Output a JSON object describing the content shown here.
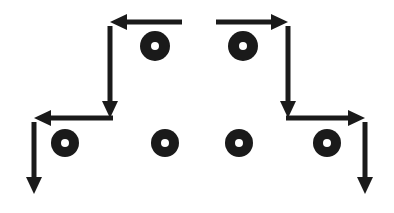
{
  "figure": {
    "canvas": {
      "width": 394,
      "height": 213,
      "background_color": "#ffffff"
    },
    "ink_color": "#1a1a1a",
    "ring_hole_color": "#ffffff"
  },
  "chart_data": {
    "type": "diagram",
    "xlabel": "",
    "ylabel": "",
    "xlim": [
      0,
      394
    ],
    "ylim": [
      0,
      213
    ],
    "grid": false,
    "legend": "none",
    "stroke_width": 5,
    "arrow_head_length": 17,
    "arrow_head_half_width": 8,
    "arrows": [
      {
        "id": "top-left-horizontal-arrow",
        "name": "top-left-horizontal-arrow",
        "orientation": "horizontal",
        "direction": "left",
        "x1": 182,
        "y1": 22,
        "x2": 110,
        "y2": 22,
        "length": 72
      },
      {
        "id": "top-right-horizontal-arrow",
        "name": "top-right-horizontal-arrow",
        "orientation": "horizontal",
        "direction": "right",
        "x1": 216,
        "y1": 22,
        "x2": 288,
        "y2": 22,
        "length": 72
      },
      {
        "id": "inner-left-vertical-arrow",
        "name": "inner-left-vertical-arrow",
        "orientation": "vertical",
        "direction": "down",
        "x1": 110,
        "y1": 26,
        "x2": 110,
        "y2": 118,
        "length": 92
      },
      {
        "id": "inner-right-vertical-arrow",
        "name": "inner-right-vertical-arrow",
        "orientation": "vertical",
        "direction": "down",
        "x1": 288,
        "y1": 26,
        "x2": 288,
        "y2": 118,
        "length": 92
      },
      {
        "id": "bottom-left-horizontal-arrow",
        "name": "bottom-left-horizontal-arrow",
        "orientation": "horizontal",
        "direction": "left",
        "x1": 113,
        "y1": 118,
        "x2": 34,
        "y2": 118,
        "length": 79
      },
      {
        "id": "bottom-right-horizontal-arrow",
        "name": "bottom-right-horizontal-arrow",
        "orientation": "horizontal",
        "direction": "right",
        "x1": 286,
        "y1": 118,
        "x2": 365,
        "y2": 118,
        "length": 79
      },
      {
        "id": "outer-left-vertical-arrow",
        "name": "outer-left-vertical-arrow",
        "orientation": "vertical",
        "direction": "down",
        "x1": 34,
        "y1": 122,
        "x2": 34,
        "y2": 194,
        "length": 72
      },
      {
        "id": "outer-right-vertical-arrow",
        "name": "outer-right-vertical-arrow",
        "orientation": "vertical",
        "direction": "down",
        "x1": 365,
        "y1": 122,
        "x2": 365,
        "y2": 194,
        "length": 72
      }
    ],
    "rings": [
      {
        "id": "ring-top-left",
        "name": "ring-top-left",
        "row": "top",
        "cx": 155,
        "cy": 46,
        "r_outer": 15,
        "r_inner": 4
      },
      {
        "id": "ring-top-right",
        "name": "ring-top-right",
        "row": "top",
        "cx": 243,
        "cy": 46,
        "r_outer": 15,
        "r_inner": 4
      },
      {
        "id": "ring-bottom-1",
        "name": "ring-bottom-1",
        "row": "bottom",
        "cx": 65,
        "cy": 143,
        "r_outer": 14,
        "r_inner": 4
      },
      {
        "id": "ring-bottom-2",
        "name": "ring-bottom-2",
        "row": "bottom",
        "cx": 165,
        "cy": 143,
        "r_outer": 14,
        "r_inner": 4
      },
      {
        "id": "ring-bottom-3",
        "name": "ring-bottom-3",
        "row": "bottom",
        "cx": 239,
        "cy": 143,
        "r_outer": 14,
        "r_inner": 4
      },
      {
        "id": "ring-bottom-4",
        "name": "ring-bottom-4",
        "row": "bottom",
        "cx": 327,
        "cy": 143,
        "r_outer": 14,
        "r_inner": 4
      }
    ]
  }
}
